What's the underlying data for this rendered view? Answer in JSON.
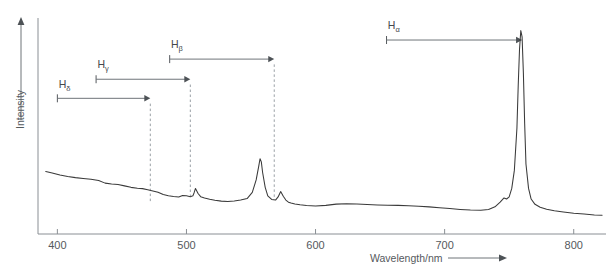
{
  "chart_data": {
    "type": "line",
    "title": "",
    "xlabel": "Wavelength/nm",
    "ylabel": "Intensity",
    "xlim": [
      385,
      825
    ],
    "ylim": [
      0,
      1
    ],
    "grid": false,
    "legend_position": "none",
    "xticks": [
      400,
      500,
      600,
      700,
      800
    ],
    "xtick_labels": [
      "400",
      "500",
      "600",
      "700",
      "800"
    ],
    "yticks": [],
    "ytick_labels": [],
    "series": [
      {
        "name": "emission-spectrum",
        "color": "#3a3a3a",
        "x": [
          391,
          396,
          402,
          408,
          414,
          420,
          426,
          432,
          437,
          442,
          447,
          452,
          457,
          462,
          466,
          470,
          474,
          478,
          482,
          486,
          490,
          494,
          497,
          500,
          503,
          505,
          506,
          507,
          509,
          511,
          514,
          518,
          522,
          527,
          532,
          537,
          542,
          547,
          551,
          554,
          556,
          557,
          558,
          559,
          561,
          563,
          566,
          569,
          571,
          573,
          575,
          577,
          579,
          581,
          584,
          588,
          593,
          600,
          608,
          616,
          624,
          632,
          640,
          648,
          656,
          664,
          672,
          680,
          688,
          696,
          704,
          712,
          720,
          728,
          734,
          739,
          743,
          746,
          748,
          750,
          752,
          754,
          756,
          757,
          758,
          759,
          760,
          761,
          762,
          763,
          765,
          767,
          770,
          774,
          779,
          785,
          792,
          800,
          808,
          816,
          822
        ],
        "y": [
          0.295,
          0.288,
          0.278,
          0.271,
          0.266,
          0.262,
          0.258,
          0.252,
          0.24,
          0.236,
          0.233,
          0.227,
          0.22,
          0.216,
          0.214,
          0.209,
          0.203,
          0.197,
          0.186,
          0.18,
          0.177,
          0.175,
          0.182,
          0.18,
          0.176,
          0.18,
          0.196,
          0.215,
          0.191,
          0.176,
          0.17,
          0.164,
          0.159,
          0.155,
          0.153,
          0.156,
          0.16,
          0.167,
          0.196,
          0.255,
          0.32,
          0.355,
          0.34,
          0.29,
          0.22,
          0.18,
          0.163,
          0.16,
          0.175,
          0.2,
          0.178,
          0.16,
          0.15,
          0.146,
          0.142,
          0.138,
          0.134,
          0.132,
          0.135,
          0.141,
          0.143,
          0.142,
          0.139,
          0.137,
          0.136,
          0.135,
          0.133,
          0.131,
          0.128,
          0.124,
          0.12,
          0.116,
          0.113,
          0.112,
          0.116,
          0.128,
          0.15,
          0.17,
          0.165,
          0.175,
          0.215,
          0.3,
          0.5,
          0.7,
          0.87,
          0.96,
          0.93,
          0.76,
          0.52,
          0.33,
          0.215,
          0.165,
          0.14,
          0.126,
          0.117,
          0.11,
          0.104,
          0.098,
          0.094,
          0.09,
          0.088
        ]
      }
    ],
    "annotations": [
      {
        "id": "h-delta",
        "label": "H",
        "subscript": "δ",
        "arrow_from_nm": 400,
        "arrow_to_nm": 472,
        "arrow_y": 0.64,
        "label_x_nm": 401,
        "label_y": 0.69,
        "dashed_line_nm": 472,
        "dashed_top_y": 0.615,
        "dashed_bottom_y": 0.15
      },
      {
        "id": "h-gamma",
        "label": "H",
        "subscript": "γ",
        "arrow_from_nm": 430,
        "arrow_to_nm": 503,
        "arrow_y": 0.73,
        "label_x_nm": 431,
        "label_y": 0.782,
        "dashed_line_nm": 503,
        "dashed_top_y": 0.705,
        "dashed_bottom_y": 0.17
      },
      {
        "id": "h-beta",
        "label": "H",
        "subscript": "β",
        "arrow_from_nm": 487,
        "arrow_to_nm": 568,
        "arrow_y": 0.825,
        "label_x_nm": 488,
        "label_y": 0.878,
        "dashed_line_nm": 568,
        "dashed_top_y": 0.8,
        "dashed_bottom_y": 0.175
      },
      {
        "id": "h-alpha",
        "label": "H",
        "subscript": "α",
        "arrow_from_nm": 655,
        "arrow_to_nm": 760,
        "arrow_y": 0.915,
        "label_x_nm": 656,
        "label_y": 0.968,
        "dashed_line_nm": null,
        "dashed_top_y": null,
        "dashed_bottom_y": null
      }
    ]
  },
  "axes": {
    "y_axis_label": "Intensity",
    "x_axis_label": "Wavelength/nm"
  }
}
